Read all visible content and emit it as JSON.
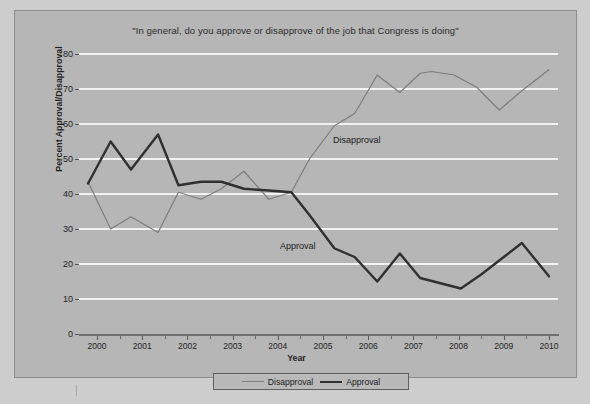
{
  "chart_data": {
    "type": "line",
    "title": "\"In general, do you approve or disapprove of the job that Congress is doing\"",
    "xlabel": "Year",
    "ylabel": "Percent Approval/Disapproval",
    "xlim": [
      1999.6,
      2010.2
    ],
    "ylim": [
      0,
      80
    ],
    "ytick_labels": [
      "0",
      "10",
      "20",
      "30",
      "40",
      "50",
      "60",
      "70",
      "80"
    ],
    "yticks": [
      0,
      10,
      20,
      30,
      40,
      50,
      60,
      70,
      80
    ],
    "xtick_labels": [
      "2000",
      "2001",
      "2002",
      "2003",
      "2004",
      "2005",
      "2006",
      "2007",
      "2008",
      "2009",
      "2010"
    ],
    "xticks": [
      2000,
      2001,
      2002,
      2003,
      2004,
      2005,
      2006,
      2007,
      2008,
      2009,
      2010
    ],
    "grid": "horizontal-white",
    "legend_position": "bottom-center",
    "annotations": [
      {
        "text": "Disapproval",
        "x": 2005.2,
        "y": 57
      },
      {
        "text": "Approval",
        "x": 2004.2,
        "y": 26
      }
    ],
    "series": [
      {
        "name": "Disapproval",
        "color": "#7d7d7d",
        "linewidth": 1.2,
        "x": [
          1999.8,
          2000.3,
          2000.75,
          2001.35,
          2001.8,
          2002.3,
          2002.75,
          2003.25,
          2003.8,
          2004.3,
          2004.7,
          2005.25,
          2005.7,
          2006.2,
          2006.7,
          2007.15,
          2007.4,
          2007.9,
          2008.4,
          2008.9,
          2009.4,
          2010.0
        ],
        "y": [
          43.5,
          30.0,
          33.5,
          29.0,
          40.5,
          38.5,
          41.5,
          46.5,
          38.5,
          40.5,
          50.0,
          59.5,
          63.0,
          74.0,
          69.0,
          74.5,
          75.0,
          74.0,
          70.5,
          64.0,
          69.5,
          75.5
        ]
      },
      {
        "name": "Approval",
        "color": "#303030",
        "linewidth": 2.4,
        "x": [
          1999.8,
          2000.3,
          2000.75,
          2001.35,
          2001.8,
          2002.3,
          2002.75,
          2003.25,
          2003.8,
          2004.3,
          2004.7,
          2005.25,
          2005.7,
          2006.2,
          2006.7,
          2007.15,
          2007.6,
          2008.05,
          2008.5,
          2009.0,
          2009.4,
          2010.0
        ],
        "y": [
          43.0,
          55.0,
          47.0,
          57.0,
          42.5,
          43.5,
          43.5,
          41.5,
          41.0,
          40.5,
          34.0,
          24.5,
          22.0,
          15.0,
          23.0,
          16.0,
          14.5,
          13.0,
          17.0,
          22.0,
          26.0,
          16.5
        ]
      }
    ]
  },
  "legend": {
    "entries": [
      {
        "label": "Disapproval"
      },
      {
        "label": "Approval"
      }
    ]
  }
}
